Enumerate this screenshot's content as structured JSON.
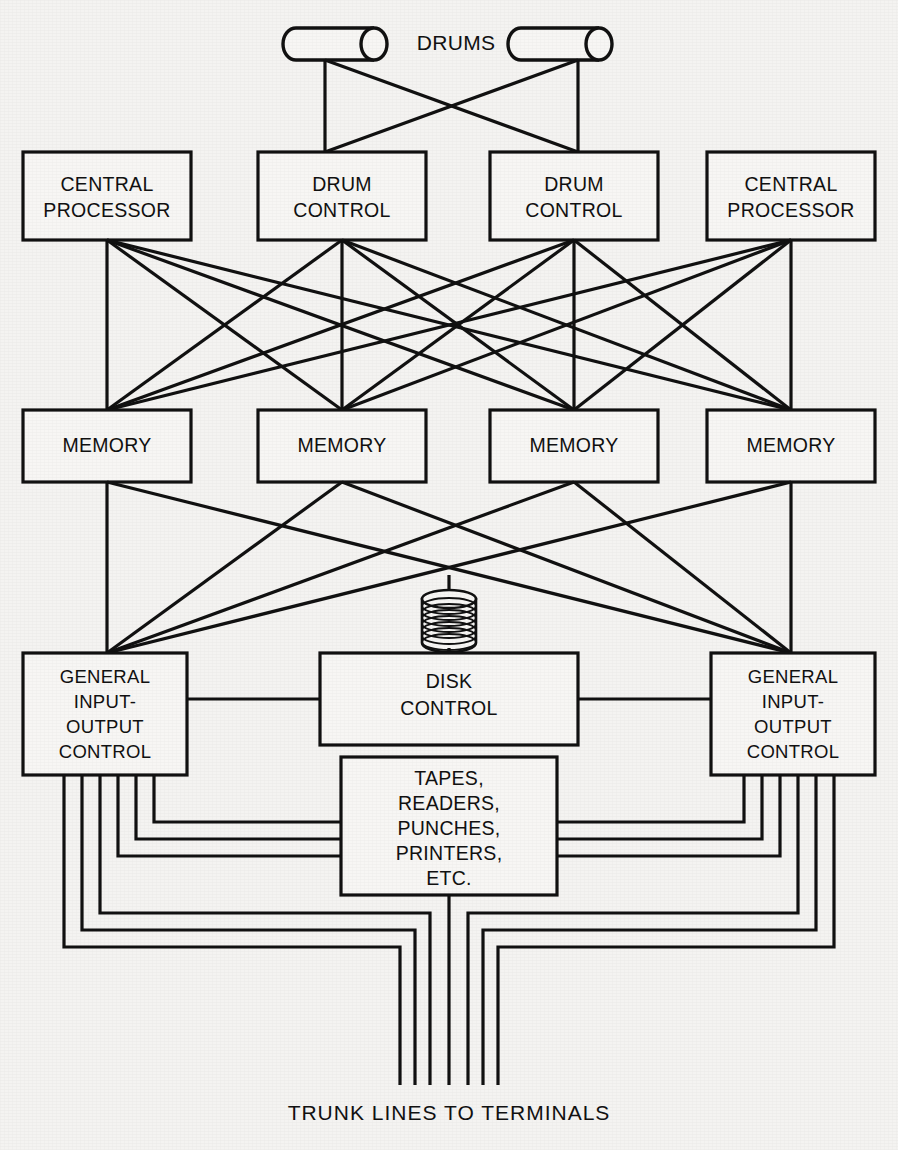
{
  "diagram": {
    "caption": "TRUNK LINES TO TERMINALS",
    "drums_label": "DRUMS",
    "line_color": "#111111",
    "box_fill": "#f7f6f4",
    "background": "#f4f3f1",
    "nodes": {
      "drum_left": {
        "label": "",
        "type": "cylinder"
      },
      "drum_right": {
        "label": "",
        "type": "cylinder"
      },
      "cpu_left": {
        "line1": "CENTRAL",
        "line2": "PROCESSOR"
      },
      "drum_control_left": {
        "line1": "DRUM",
        "line2": "CONTROL"
      },
      "drum_control_right": {
        "line1": "DRUM",
        "line2": "CONTROL"
      },
      "cpu_right": {
        "line1": "CENTRAL",
        "line2": "PROCESSOR"
      },
      "memory_1": {
        "label": "MEMORY"
      },
      "memory_2": {
        "label": "MEMORY"
      },
      "memory_3": {
        "label": "MEMORY"
      },
      "memory_4": {
        "label": "MEMORY"
      },
      "disk_pack": {
        "label": "",
        "type": "disk-stack"
      },
      "disk_control": {
        "line1": "DISK",
        "line2": "CONTROL"
      },
      "gioc_left": {
        "line1": "GENERAL",
        "line2": "INPUT-",
        "line3": "OUTPUT",
        "line4": "CONTROL"
      },
      "gioc_right": {
        "line1": "GENERAL",
        "line2": "INPUT-",
        "line3": "OUTPUT",
        "line4": "CONTROL"
      },
      "peripherals": {
        "line1": "TAPES,",
        "line2": "READERS,",
        "line3": "PUNCHES,",
        "line4": "PRINTERS,",
        "line5": "ETC."
      }
    },
    "counts": {
      "drums": 2,
      "central_processors": 2,
      "drum_controls": 2,
      "memories": 4,
      "gioc_units": 2,
      "trunk_lines": 6
    }
  }
}
